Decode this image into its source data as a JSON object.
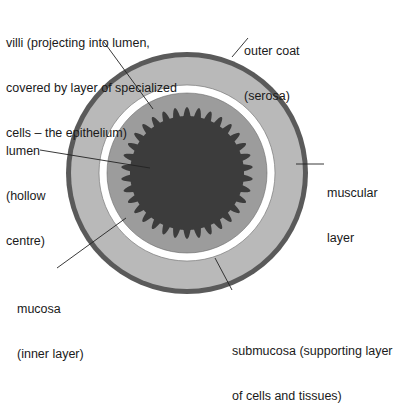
{
  "diagram": {
    "type": "cross-section",
    "colors": {
      "serosa": "#5a5a5a",
      "muscular": "#b8b8b8",
      "submucosa": "#ffffff",
      "mucosa": "#999999",
      "villi_lumen": "#3a3a3a",
      "leader_line": "#222222",
      "background": "#ffffff"
    },
    "labels": {
      "villi": {
        "line1": "villi (projecting into lumen,",
        "line2": "covered by layer of specialized",
        "line3": "cells – the epithelium)"
      },
      "outer_coat": {
        "line1": "outer coat",
        "line2": "(serosa)"
      },
      "lumen": {
        "line1": "lumen",
        "line2": "(hollow",
        "line3": "centre)"
      },
      "muscular": {
        "line1": "muscular",
        "line2": "layer"
      },
      "mucosa": {
        "line1": "mucosa",
        "line2": "(inner layer)"
      },
      "submucosa": {
        "line1": "submucosa (supporting layer",
        "line2": "of cells and tissues)"
      }
    }
  }
}
